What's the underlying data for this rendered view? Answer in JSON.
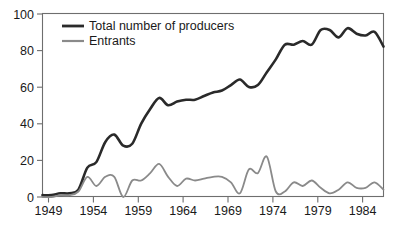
{
  "chart_data": {
    "type": "line",
    "title": "",
    "xlabel": "",
    "ylabel": "",
    "xlim": [
      1949,
      1987
    ],
    "ylim": [
      0,
      100
    ],
    "grid": false,
    "legend_position": "top-left",
    "x_ticks": [
      "1949",
      "1954",
      "1959",
      "1964",
      "1969",
      "1974",
      "1979",
      "1984"
    ],
    "x_tick_values": [
      1949,
      1954,
      1959,
      1964,
      1969,
      1974,
      1979,
      1984
    ],
    "y_ticks": [
      "0",
      "20",
      "40",
      "60",
      "80",
      "100"
    ],
    "y_tick_values": [
      0,
      20,
      40,
      60,
      80,
      100
    ],
    "x": [
      1949,
      1950,
      1951,
      1952,
      1953,
      1954,
      1955,
      1956,
      1957,
      1958,
      1959,
      1960,
      1961,
      1962,
      1963,
      1964,
      1965,
      1966,
      1967,
      1968,
      1969,
      1970,
      1971,
      1972,
      1973,
      1974,
      1975,
      1976,
      1977,
      1978,
      1979,
      1980,
      1981,
      1982,
      1983,
      1984,
      1985,
      1986,
      1987
    ],
    "series": [
      {
        "name": "Total number of producers",
        "color": "#2a2a2a",
        "line_width": 2.6,
        "values": [
          1,
          1,
          2,
          2,
          4,
          16,
          19,
          30,
          34,
          28,
          29,
          40,
          48,
          54,
          50,
          52,
          53,
          53,
          55,
          57,
          58,
          61,
          64,
          60,
          61,
          68,
          75,
          83,
          83,
          85,
          83,
          91,
          91,
          87,
          92,
          89,
          88,
          90,
          82
        ]
      },
      {
        "name": "Entrants",
        "color": "#8a8a8a",
        "line_width": 1.8,
        "values": [
          0,
          0,
          1,
          1,
          3,
          11,
          6,
          11,
          11,
          0,
          9,
          9,
          13,
          18,
          11,
          6,
          10,
          9,
          10,
          11,
          11,
          8,
          2,
          15,
          13,
          22,
          3,
          3,
          8,
          6,
          9,
          5,
          2,
          4,
          8,
          5,
          5,
          8,
          4
        ]
      }
    ]
  },
  "legend": {
    "items": [
      {
        "label": "Total number of producers",
        "color": "#2a2a2a"
      },
      {
        "label": "Entrants",
        "color": "#8a8a8a"
      }
    ]
  },
  "axes": {
    "y_label_0": "0",
    "y_label_20": "20",
    "y_label_40": "40",
    "y_label_60": "60",
    "y_label_80": "80",
    "y_label_100": "100",
    "x_label_1949": "1949",
    "x_label_1954": "1954",
    "x_label_1959": "1959",
    "x_label_1964": "1964",
    "x_label_1969": "1969",
    "x_label_1974": "1974",
    "x_label_1979": "1979",
    "x_label_1984": "1984"
  }
}
